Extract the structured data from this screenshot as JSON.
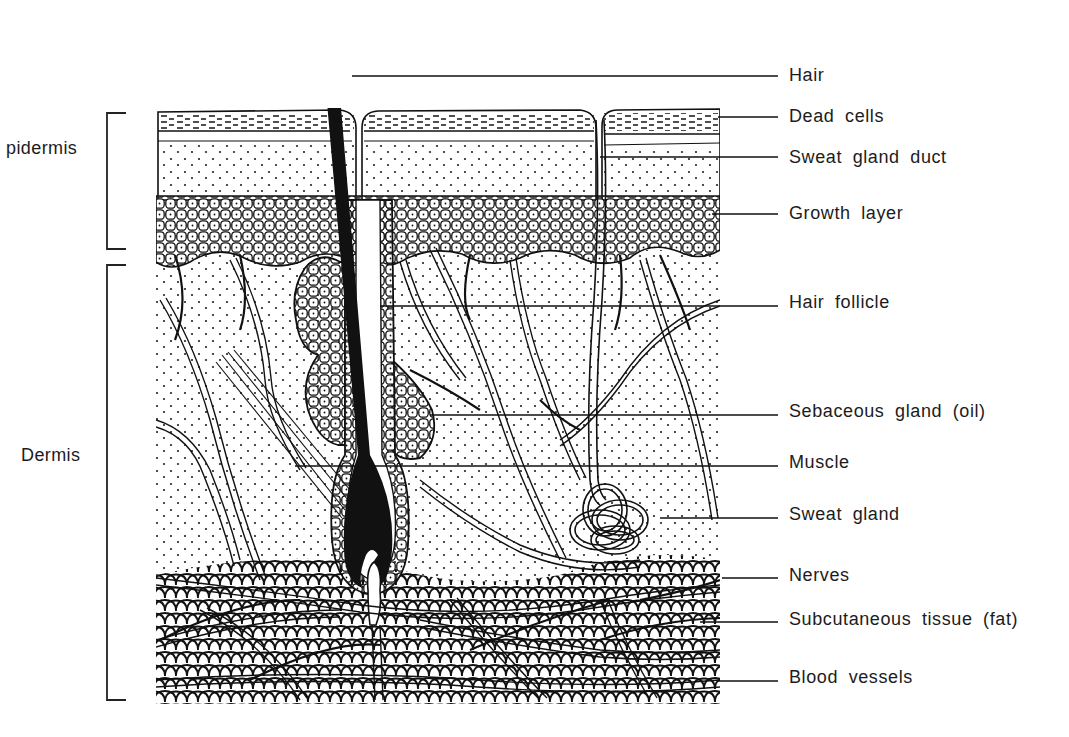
{
  "diagram": {
    "colors": {
      "ink": "#111111",
      "paper": "#ffffff"
    },
    "layers": [
      {
        "label": "pidermis",
        "full_label": "Epidermis",
        "bracket": [
          113,
          249
        ],
        "text_y": 148
      },
      {
        "label": "Dermis",
        "bracket": [
          265,
          700
        ],
        "text_y": 455
      }
    ],
    "callouts": [
      {
        "label": "Hair",
        "y": 76,
        "line_from_x": 352,
        "line_to_x": 778
      },
      {
        "label": "Dead cells",
        "y": 117,
        "line_from_x": 718,
        "line_to_x": 778
      },
      {
        "label": "Sweat gland duct",
        "y": 157,
        "line_from_x": 600,
        "line_to_x": 778
      },
      {
        "label": "Growth layer",
        "y": 214,
        "line_from_x": 712,
        "line_to_x": 778
      },
      {
        "label": "Hair follicle",
        "y": 306,
        "line_from_x": 380,
        "line_to_x": 778
      },
      {
        "label": "Sebaceous gland (oil)",
        "y": 415,
        "line_from_x": 430,
        "line_to_x": 778
      },
      {
        "label": "Muscle",
        "y": 466,
        "line_from_x": 295,
        "line_to_x": 778
      },
      {
        "label": "Sweat gland",
        "y": 518,
        "line_from_x": 660,
        "line_to_x": 778
      },
      {
        "label": "Nerves",
        "y": 578,
        "line_from_x": 722,
        "line_to_x": 778
      },
      {
        "label": "Subcutaneous tissue (fat)",
        "y": 622,
        "line_from_x": 700,
        "line_to_x": 778
      },
      {
        "label": "Blood vessels",
        "y": 681,
        "line_from_x": 718,
        "line_to_x": 778
      }
    ]
  }
}
